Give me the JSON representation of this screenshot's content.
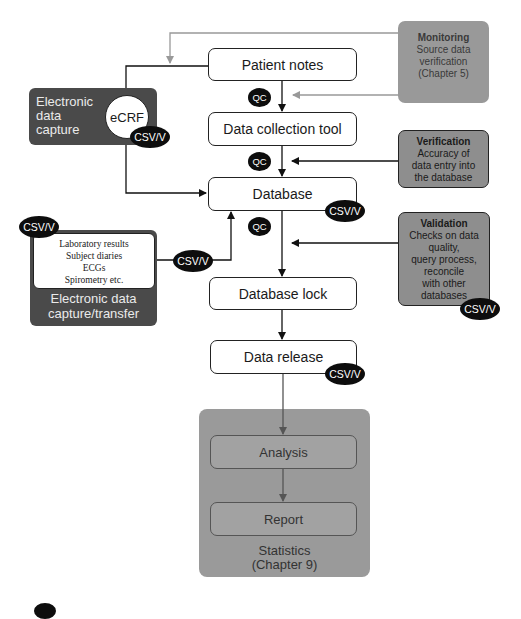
{
  "flow": {
    "patient_notes": "Patient notes",
    "data_collection_tool": "Data collection tool",
    "database": "Database",
    "database_lock": "Database lock",
    "data_release": "Data release"
  },
  "badges": {
    "qc": "QC",
    "csv": "CSV/V"
  },
  "edc": {
    "label_line1": "Electronic",
    "label_line2": "data",
    "label_line3": "capture",
    "ecrf": "eCRF"
  },
  "transfer": {
    "items": [
      "Laboratory results",
      "Subject diaries",
      "ECGs",
      "Spirometry etc."
    ],
    "label_line1": "Electronic data",
    "label_line2": "capture/transfer"
  },
  "monitoring": {
    "title": "Monitoring",
    "lines": [
      "Source data",
      "verification",
      "(Chapter 5)"
    ]
  },
  "verification": {
    "title": "Verification",
    "lines": [
      "Accuracy of",
      "data entry into",
      "the database"
    ]
  },
  "validation": {
    "title": "Validation",
    "lines": [
      "Checks on data",
      "quality,",
      "query process,",
      "reconcile",
      "with other",
      "databases"
    ]
  },
  "statistics": {
    "analysis": "Analysis",
    "report": "Report",
    "label_line1": "Statistics",
    "label_line2": "(Chapter 9)"
  },
  "colors": {
    "badge": "#0d0d0d",
    "side_box": "#8e8e8e",
    "dark_box": "#4a4a4a",
    "statistics_bg": "#9a9a9a"
  }
}
